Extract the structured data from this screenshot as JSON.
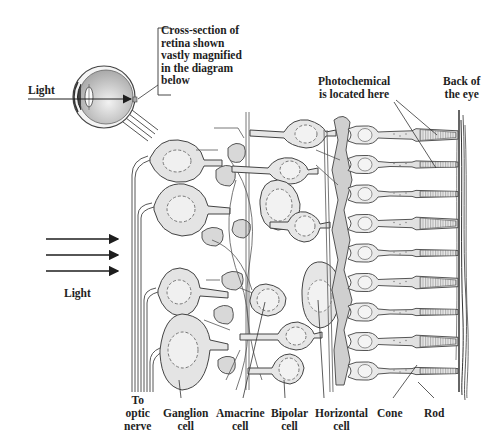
{
  "diagram": {
    "colors": {
      "background": "#ffffff",
      "ink": "#3a3a3a",
      "cell_fill": "#e6e6e6",
      "cell_fill_dark": "#cfcfcf",
      "eye_fill": "#c9c9c9",
      "label": "#1e1e1e"
    },
    "inset": {
      "light_label": "Light",
      "callout_lines": [
        "Cross-section of",
        "retina shown",
        "vastly magnified",
        "in the diagram",
        "below"
      ]
    },
    "main": {
      "light_label": "Light",
      "light_arrows": 3,
      "photochemical_lines": [
        "Photochemical",
        "is located here"
      ],
      "back_of_eye_lines": [
        "Back of",
        "the eye"
      ]
    },
    "bottom_labels": [
      {
        "id": "optic-nerve",
        "lines": [
          "To",
          "optic",
          "nerve"
        ]
      },
      {
        "id": "ganglion-cell",
        "lines": [
          "Ganglion",
          "cell"
        ]
      },
      {
        "id": "amacrine-cell",
        "lines": [
          "Amacrine",
          "cell"
        ]
      },
      {
        "id": "bipolar-cell",
        "lines": [
          "Bipolar",
          "cell"
        ]
      },
      {
        "id": "horizontal-cell",
        "lines": [
          "Horizontal",
          "cell"
        ]
      },
      {
        "id": "cone",
        "lines": [
          "Cone"
        ]
      },
      {
        "id": "rod",
        "lines": [
          "Rod"
        ]
      }
    ],
    "photoreceptors": [
      "cone",
      "rod",
      "rod",
      "cone",
      "rod",
      "cone",
      "rod",
      "cone",
      "rod"
    ]
  }
}
